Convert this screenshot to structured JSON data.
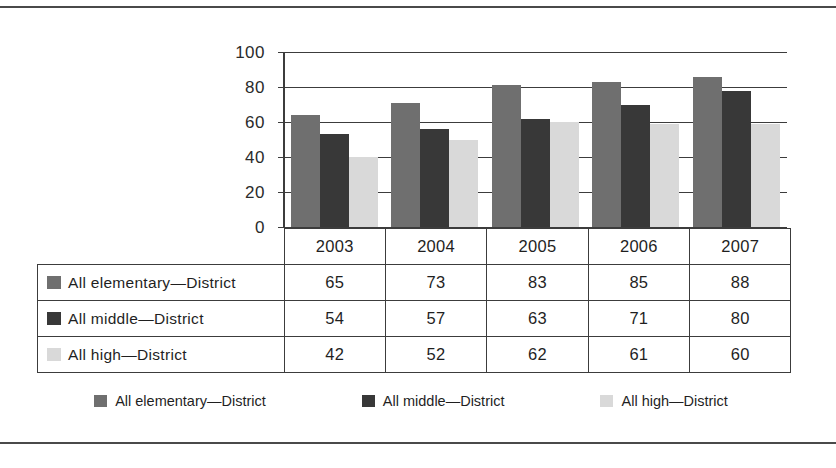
{
  "chart_data": {
    "type": "bar",
    "title": "",
    "xlabel": "",
    "ylabel": "",
    "categories": [
      "2003",
      "2004",
      "2005",
      "2006",
      "2007"
    ],
    "ylim": [
      0,
      100
    ],
    "yticks": [
      0,
      20,
      40,
      60,
      80,
      100
    ],
    "grid": true,
    "legend_position": "bottom",
    "series": [
      {
        "name": "All elementary—District",
        "color": "#6f6f6f",
        "values": [
          65,
          73,
          83,
          85,
          88
        ],
        "plotted_values": [
          64,
          71,
          81,
          83,
          86
        ]
      },
      {
        "name": "All middle—District",
        "color": "#383838",
        "values": [
          54,
          57,
          63,
          71,
          80
        ],
        "plotted_values": [
          53,
          56,
          62,
          70,
          78
        ]
      },
      {
        "name": "All high—District",
        "color": "#d9d9d9",
        "values": [
          42,
          52,
          62,
          61,
          60
        ],
        "plotted_values": [
          40,
          50,
          60,
          59,
          59
        ]
      }
    ]
  },
  "table": {
    "header_corner": "",
    "columns": [
      "2003",
      "2004",
      "2005",
      "2006",
      "2007"
    ],
    "rows": [
      {
        "label": "All elementary—District",
        "swatch": "s0",
        "values": [
          "65",
          "73",
          "83",
          "85",
          "88"
        ]
      },
      {
        "label": "All middle—District",
        "swatch": "s1",
        "values": [
          "54",
          "57",
          "63",
          "71",
          "80"
        ]
      },
      {
        "label": "All high—District",
        "swatch": "s2",
        "values": [
          "42",
          "52",
          "62",
          "61",
          "60"
        ]
      }
    ]
  },
  "legend": {
    "items": [
      {
        "label": "All elementary—District",
        "color": "#6f6f6f"
      },
      {
        "label": "All middle—District",
        "color": "#383838"
      },
      {
        "label": "All high—District",
        "color": "#d9d9d9"
      }
    ]
  },
  "axis": {
    "ytick_labels": [
      "100",
      "80",
      "60",
      "40",
      "20",
      "0"
    ]
  }
}
